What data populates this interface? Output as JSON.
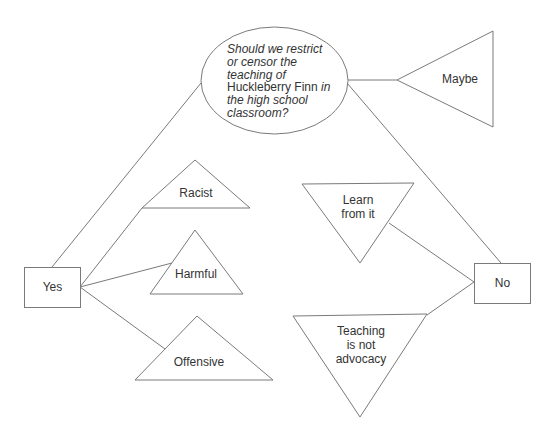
{
  "diagram": {
    "question": {
      "lines": [
        {
          "parts": [
            {
              "text": "Should we restrict",
              "italic": true
            }
          ]
        },
        {
          "parts": [
            {
              "text": "or censor the",
              "italic": true
            }
          ]
        },
        {
          "parts": [
            {
              "text": "teaching of",
              "italic": true
            }
          ]
        },
        {
          "parts": [
            {
              "text": "Huckleberry Finn",
              "italic": false
            },
            {
              "text": " in",
              "italic": true
            }
          ]
        },
        {
          "parts": [
            {
              "text": "the high school",
              "italic": true
            }
          ]
        },
        {
          "parts": [
            {
              "text": "classroom?",
              "italic": true
            }
          ]
        }
      ],
      "line1": "Should we restrict",
      "line2": "or censor the",
      "line3": "teaching of",
      "line4_title": "Huckleberry Finn",
      "line4_rest": " in",
      "line5": "the high school",
      "line6": "classroom?"
    },
    "options": {
      "yes": "Yes",
      "no": "No",
      "maybe": "Maybe"
    },
    "yes_reasons": {
      "racist": "Racist",
      "harmful": "Harmful",
      "offensive": "Offensive"
    },
    "no_reasons": {
      "learn_line1": "Learn",
      "learn_line2": "from it",
      "teaching_line1": "Teaching",
      "teaching_line2": "is not",
      "teaching_line3": "advocacy"
    },
    "colors": {
      "stroke": "#7a7a7a",
      "text": "#333333",
      "background": "#ffffff"
    }
  }
}
